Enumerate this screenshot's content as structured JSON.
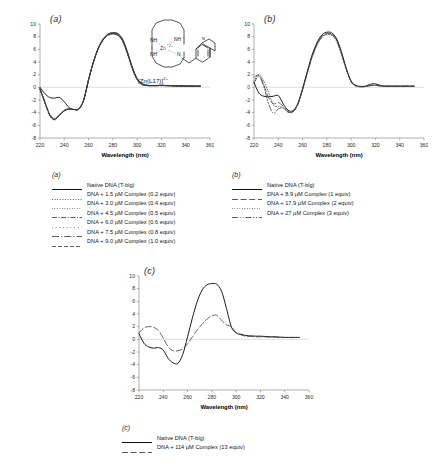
{
  "figure": {
    "caption_axis_x": "Wavelength (nm)",
    "panels": [
      "(a)",
      "(b)",
      "(c)"
    ]
  },
  "inset": {
    "name": "zinc-cyclen-quinoline-complex",
    "label_main": "[Zn(L17)]",
    "label_charge": "2+",
    "atoms": [
      "NH",
      "NH",
      "NH",
      "N",
      "N",
      "Zn2+"
    ],
    "metal_label": "Zn",
    "metal_charge": "2+"
  },
  "axes": {
    "x_label": "Wavelength (nm)",
    "x_ticks": [
      220,
      240,
      260,
      280,
      300,
      320,
      340,
      360
    ],
    "x_min": 220,
    "x_max": 360,
    "y_ticks": [
      -8,
      -6,
      -4,
      -2,
      0,
      2,
      4,
      6,
      8,
      10
    ],
    "y_min": -8,
    "y_max": 10,
    "grid": false,
    "zero_line": true
  },
  "legends": {
    "a": {
      "title": "(a)",
      "entries": [
        {
          "label": "Native DNA (T-blg)",
          "style": "solid",
          "color": "#101010"
        },
        {
          "label": "DNA + 1.5 µM Complex (0.2 equiv)",
          "style": "dotted",
          "color": "#4f4f4f"
        },
        {
          "label": "DNA + 3.0 µM Complex (0.4 equiv)",
          "style": "fine-dotted",
          "color": "#8a8a8a"
        },
        {
          "label": "DNA + 4.5 µM Complex (0.5 equiv)",
          "style": "dash-dot",
          "color": "#2f2f2f"
        },
        {
          "label": "DNA + 6.0 µM Complex (0.6 equiv)",
          "style": "sparse-dotted",
          "color": "#9a9a9a"
        },
        {
          "label": "DNA + 7.5 µM Complex (0.8 equiv)",
          "style": "dash-dot-long",
          "color": "#262626"
        },
        {
          "label": "DNA + 9.0 µM Complex (1.0 equiv)",
          "style": "dashed",
          "color": "#1a1a1a"
        }
      ]
    },
    "b": {
      "title": "(b)",
      "entries": [
        {
          "label": "Native DNA (T-blg)",
          "style": "solid",
          "color": "#101010"
        },
        {
          "label": "DNA + 8.9 µM Complex (1 equiv)",
          "style": "dashed-long",
          "color": "#2a2a2a"
        },
        {
          "label": "DNA + 17.9 µM Complex (2 equiv)",
          "style": "fine-dotted",
          "color": "#9a9a9a"
        },
        {
          "label": "DNA + 27 µM Complex (3 equiv)",
          "style": "dash-dot-dot",
          "color": "#3a3a3a"
        }
      ]
    },
    "c": {
      "title": "(c)",
      "entries": [
        {
          "label": "Native DNA (T-blg)",
          "style": "solid",
          "color": "#101010"
        },
        {
          "label": "DNA + 114 µM Complex (13 equiv)",
          "style": "dashed-long",
          "color": "#2a2a2a"
        }
      ]
    }
  },
  "chart_data": [
    {
      "type": "line",
      "panel": "(a)",
      "title": "",
      "xlabel": "Wavelength (nm)",
      "ylabel": "",
      "xlim": [
        220,
        360
      ],
      "ylim": [
        -8,
        10
      ],
      "x": [
        220,
        224,
        228,
        232,
        236,
        240,
        244,
        248,
        252,
        256,
        260,
        264,
        268,
        272,
        276,
        280,
        284,
        288,
        292,
        296,
        300,
        304,
        308,
        312,
        316,
        320,
        324,
        328,
        332,
        336,
        340,
        344,
        348,
        352
      ],
      "series": [
        {
          "name": "Native DNA (T-blg)",
          "style": "solid",
          "values": [
            0.0,
            -1.0,
            -1.6,
            -1.7,
            -1.6,
            -2.3,
            -3.2,
            -3.5,
            -3.4,
            -2.0,
            1.2,
            4.0,
            6.2,
            7.6,
            8.4,
            8.6,
            8.5,
            7.6,
            5.6,
            3.2,
            1.4,
            0.6,
            0.35,
            0.3,
            0.3,
            0.35,
            0.3,
            0.28,
            0.25,
            0.25,
            0.22,
            0.2,
            0.2,
            0.2
          ]
        },
        {
          "name": "DNA + 1.5 µM Complex (0.2 equiv)",
          "style": "dotted",
          "values": [
            -0.2,
            -2.2,
            -4.2,
            -4.9,
            -4.3,
            -3.6,
            -3.4,
            -3.5,
            -3.4,
            -2.0,
            1.2,
            4.0,
            6.2,
            7.6,
            8.4,
            8.6,
            8.4,
            7.5,
            5.5,
            3.1,
            1.3,
            0.5,
            0.3,
            0.28,
            0.28,
            0.3,
            0.28,
            0.25,
            0.22,
            0.22,
            0.2,
            0.2,
            0.18,
            0.18
          ]
        },
        {
          "name": "DNA + 3.0 µM Complex (0.4 equiv)",
          "style": "fine-dotted",
          "values": [
            -0.3,
            -2.4,
            -4.4,
            -5.1,
            -4.4,
            -3.7,
            -3.4,
            -3.5,
            -3.4,
            -2.0,
            1.2,
            4.0,
            6.2,
            7.6,
            8.3,
            8.5,
            8.3,
            7.4,
            5.4,
            3.1,
            1.3,
            0.5,
            0.3,
            0.28,
            0.28,
            0.3,
            0.28,
            0.25,
            0.22,
            0.22,
            0.2,
            0.2,
            0.18,
            0.18
          ]
        },
        {
          "name": "DNA + 4.5 µM Complex (0.5 equiv)",
          "style": "dash-dot",
          "values": [
            -0.25,
            -2.3,
            -4.3,
            -5.0,
            -4.35,
            -3.65,
            -3.4,
            -3.5,
            -3.4,
            -2.0,
            1.2,
            4.0,
            6.2,
            7.6,
            8.35,
            8.55,
            8.35,
            7.45,
            5.45,
            3.1,
            1.3,
            0.5,
            0.3,
            0.28,
            0.28,
            0.3,
            0.28,
            0.25,
            0.22,
            0.22,
            0.2,
            0.2,
            0.18,
            0.18
          ]
        },
        {
          "name": "DNA + 6.0 µM Complex (0.6 equiv)",
          "style": "sparse-dotted",
          "values": [
            -0.28,
            -2.35,
            -4.35,
            -5.05,
            -4.38,
            -3.68,
            -3.4,
            -3.5,
            -3.4,
            -2.0,
            1.2,
            4.0,
            6.15,
            7.55,
            8.3,
            8.5,
            8.3,
            7.4,
            5.4,
            3.05,
            1.28,
            0.48,
            0.3,
            0.28,
            0.28,
            0.3,
            0.28,
            0.25,
            0.22,
            0.22,
            0.2,
            0.2,
            0.18,
            0.18
          ]
        },
        {
          "name": "DNA + 7.5 µM Complex (0.8 equiv)",
          "style": "dash-dot-long",
          "values": [
            -0.3,
            -2.4,
            -4.4,
            -5.1,
            -4.4,
            -3.7,
            -3.42,
            -3.5,
            -3.4,
            -2.0,
            1.2,
            3.95,
            6.1,
            7.5,
            8.25,
            8.45,
            8.25,
            7.35,
            5.35,
            3.0,
            1.25,
            0.45,
            0.28,
            0.26,
            0.26,
            0.28,
            0.26,
            0.24,
            0.2,
            0.2,
            0.18,
            0.18,
            0.16,
            0.16
          ]
        },
        {
          "name": "DNA + 9.0 µM Complex (1.0 equiv)",
          "style": "dashed",
          "values": [
            -0.32,
            -2.45,
            -4.45,
            -5.15,
            -4.45,
            -3.72,
            -3.44,
            -3.52,
            -3.42,
            -2.0,
            1.18,
            3.9,
            6.05,
            7.45,
            8.2,
            8.4,
            8.2,
            7.3,
            5.3,
            2.95,
            1.2,
            0.42,
            0.26,
            0.24,
            0.24,
            0.26,
            0.24,
            0.22,
            0.2,
            0.2,
            0.18,
            0.18,
            0.16,
            0.16
          ]
        }
      ]
    },
    {
      "type": "line",
      "panel": "(b)",
      "title": "",
      "xlabel": "Wavelength (nm)",
      "ylabel": "",
      "xlim": [
        220,
        360
      ],
      "ylim": [
        -8,
        10
      ],
      "x": [
        220,
        224,
        228,
        232,
        236,
        240,
        244,
        248,
        252,
        256,
        260,
        264,
        268,
        272,
        276,
        280,
        284,
        288,
        292,
        296,
        300,
        304,
        308,
        312,
        316,
        320,
        324,
        328,
        332,
        336,
        340,
        344,
        348,
        352
      ],
      "series": [
        {
          "name": "Native DNA (T-blg)",
          "style": "solid",
          "values": [
            0.8,
            -0.9,
            -1.4,
            -1.5,
            -1.4,
            -1.3,
            -2.6,
            -3.6,
            -3.7,
            -2.6,
            -0.2,
            2.6,
            5.2,
            7.1,
            8.3,
            8.7,
            8.6,
            7.7,
            5.6,
            3.0,
            1.0,
            0.3,
            0.15,
            0.2,
            0.5,
            0.55,
            0.3,
            0.2,
            0.2,
            0.2,
            0.2,
            0.2,
            0.2,
            0.2
          ]
        },
        {
          "name": "DNA + 8.9 µM Complex (1 equiv)",
          "style": "dashed-long",
          "values": [
            1.6,
            1.9,
            0.4,
            -1.6,
            -2.6,
            -2.4,
            -3.0,
            -3.8,
            -3.8,
            -2.7,
            -0.3,
            2.4,
            5.0,
            6.9,
            8.1,
            8.5,
            8.4,
            7.5,
            5.4,
            2.9,
            0.9,
            0.25,
            0.1,
            0.15,
            0.3,
            0.35,
            0.25,
            0.18,
            0.18,
            0.18,
            0.18,
            0.18,
            0.18,
            0.18
          ]
        },
        {
          "name": "DNA + 17.9 µM Complex (2 equiv)",
          "style": "fine-dotted",
          "values": [
            1.0,
            2.0,
            1.0,
            -0.8,
            -2.8,
            -3.0,
            -3.2,
            -3.9,
            -3.9,
            -2.8,
            -0.4,
            2.3,
            4.8,
            6.7,
            7.9,
            8.3,
            8.2,
            7.3,
            5.2,
            2.8,
            0.85,
            0.2,
            0.08,
            0.12,
            0.25,
            0.3,
            0.2,
            0.15,
            0.15,
            0.15,
            0.15,
            0.15,
            0.15,
            0.15
          ]
        },
        {
          "name": "DNA + 27 µM Complex (3 equiv)",
          "style": "dash-dot-dot",
          "values": [
            0.6,
            1.8,
            0.2,
            -2.6,
            -4.1,
            -3.4,
            -3.3,
            -3.9,
            -3.85,
            -2.75,
            -0.35,
            2.35,
            4.9,
            6.8,
            8.0,
            8.4,
            8.3,
            7.4,
            5.3,
            2.85,
            0.88,
            0.22,
            0.1,
            0.14,
            0.28,
            0.32,
            0.22,
            0.16,
            0.16,
            0.16,
            0.16,
            0.16,
            0.16,
            0.16
          ]
        }
      ]
    },
    {
      "type": "line",
      "panel": "(c)",
      "title": "",
      "xlabel": "Wavelength (nm)",
      "ylabel": "",
      "xlim": [
        220,
        360
      ],
      "ylim": [
        -8,
        10
      ],
      "x": [
        220,
        224,
        228,
        232,
        236,
        240,
        244,
        248,
        252,
        256,
        260,
        264,
        268,
        272,
        276,
        280,
        284,
        288,
        292,
        296,
        300,
        304,
        308,
        312,
        316,
        320,
        324,
        328,
        332,
        336,
        340,
        344,
        348,
        352
      ],
      "series": [
        {
          "name": "Native DNA (T-blg)",
          "style": "solid",
          "values": [
            0.9,
            -0.6,
            -1.2,
            -1.4,
            -1.3,
            -1.7,
            -3.0,
            -3.7,
            -3.8,
            -2.4,
            0.4,
            3.4,
            6.0,
            7.8,
            8.6,
            8.8,
            8.7,
            7.6,
            4.9,
            2.0,
            1.0,
            0.8,
            0.6,
            0.55,
            0.5,
            0.5,
            0.45,
            0.4,
            0.4,
            0.35,
            0.3,
            0.3,
            0.3,
            0.3
          ]
        },
        {
          "name": "DNA + 114 µM Complex (13 equiv)",
          "style": "dashed-long",
          "values": [
            1.0,
            1.8,
            2.0,
            1.9,
            1.4,
            0.2,
            -1.2,
            -1.8,
            -1.8,
            -1.5,
            -0.7,
            0.4,
            1.5,
            2.4,
            3.2,
            3.7,
            3.8,
            3.0,
            2.3,
            2.0,
            1.1,
            0.7,
            0.5,
            0.45,
            0.4,
            0.4,
            0.38,
            0.35,
            0.35,
            0.3,
            0.3,
            0.3,
            0.3,
            0.3
          ]
        }
      ]
    }
  ]
}
